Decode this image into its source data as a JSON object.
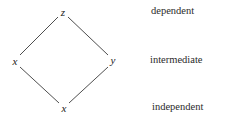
{
  "diagram": {
    "type": "hasse-diamond",
    "nodes": {
      "top": {
        "label": "z",
        "x": 63,
        "y": 13
      },
      "left": {
        "label": "x",
        "x": 15,
        "y": 62
      },
      "right": {
        "label": "y",
        "x": 113,
        "y": 61
      },
      "bottom": {
        "label": "x",
        "x": 64,
        "y": 109
      }
    },
    "edges": [
      {
        "from": "top",
        "to": "left"
      },
      {
        "from": "top",
        "to": "right"
      },
      {
        "from": "left",
        "to": "bottom"
      },
      {
        "from": "right",
        "to": "bottom"
      }
    ],
    "levels": [
      {
        "label": "dependent"
      },
      {
        "label": "intermediate"
      },
      {
        "label": "independent"
      }
    ],
    "colors": {
      "line": "#3a3a3a",
      "text": "#222222"
    }
  }
}
